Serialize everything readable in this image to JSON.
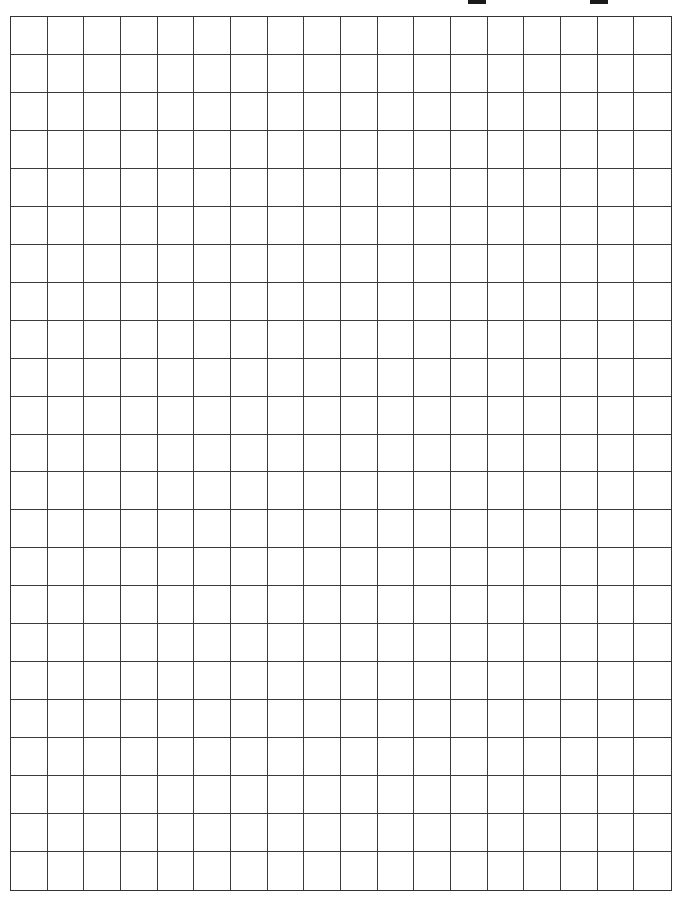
{
  "page": {
    "type": "graph-paper-worksheet",
    "background_color": "#ffffff",
    "line_color": "#333333"
  },
  "header": {
    "blank_fields": [
      {
        "name": "field-1-underline",
        "x": 468,
        "width": 18
      },
      {
        "name": "field-2-underline",
        "x": 590,
        "width": 18
      }
    ]
  },
  "grid": {
    "columns": 18,
    "rows": 23,
    "cell_width_px": 36.8,
    "cell_height_px": 38,
    "cells_filled": 0
  }
}
